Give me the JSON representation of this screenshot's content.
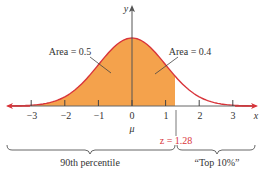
{
  "chart_data": {
    "type": "area",
    "xlabel": "x",
    "ylabel": "y",
    "x_ticks": [
      -3,
      -2,
      -1,
      0,
      1,
      2,
      3
    ],
    "x_tick_labels": [
      "−3",
      "−2",
      "−1",
      "0",
      "1",
      "2",
      "3"
    ],
    "mean_label": "μ",
    "shaded_region": {
      "from": "-inf",
      "to": 1.28,
      "area": 0.9
    },
    "annotations": [
      {
        "text": "Area = 0.5",
        "points_to": "left of mean"
      },
      {
        "text": "Area = 0.4",
        "points_to": "between 0 and 1.28"
      },
      {
        "text": "z = 1.28",
        "x": 1.28
      },
      {
        "text": "90th percentile",
        "span": [
          "-inf",
          1.28
        ]
      },
      {
        "text": "“Top 10%”",
        "span": [
          1.28,
          "inf"
        ]
      }
    ],
    "colors": {
      "fill": "#F4A24C",
      "curve": "#D8343A",
      "axis": "#555555",
      "z_label": "#D8343A"
    }
  },
  "labels": {
    "y_axis": "y",
    "x_axis": "x",
    "mu": "μ",
    "area_left": "Area = 0.5",
    "area_right": "Area = 0.4",
    "z_value": "z = 1.28",
    "percentile": "90th percentile",
    "top": "“Top 10%”",
    "ticks": [
      "−3",
      "−2",
      "−1",
      "0",
      "1",
      "2",
      "3"
    ]
  }
}
